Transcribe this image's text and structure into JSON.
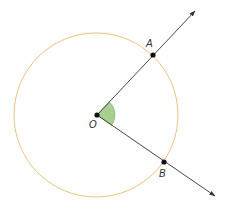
{
  "diagram": {
    "type": "geometry",
    "colors": {
      "circle": "#f0c27a",
      "ray": "#333333",
      "point": "#111111",
      "angle_fill": "#a8cf8e",
      "angle_stroke": "#7fb069",
      "label": "#333333"
    },
    "circle": {
      "center": "O",
      "cx": 96,
      "cy": 115,
      "r": 82
    },
    "points": [
      {
        "name": "O",
        "label": "O",
        "x": 97,
        "y": 115,
        "label_x": 89,
        "label_y": 128
      },
      {
        "name": "A",
        "label": "A",
        "x": 153,
        "y": 55,
        "label_x": 146,
        "label_y": 47
      },
      {
        "name": "B",
        "label": "B",
        "x": 164,
        "y": 162,
        "label_x": 159,
        "label_y": 177
      }
    ],
    "rays": [
      {
        "name": "ray-OA",
        "from": "O",
        "through": "A",
        "x1": 97,
        "y1": 115,
        "x2": 195,
        "y2": 11
      },
      {
        "name": "ray-OB",
        "from": "O",
        "through": "B",
        "x1": 97,
        "y1": 115,
        "x2": 215,
        "y2": 196
      }
    ],
    "angle": {
      "vertex": "O",
      "between": [
        "A",
        "B"
      ],
      "radius": 18
    }
  }
}
